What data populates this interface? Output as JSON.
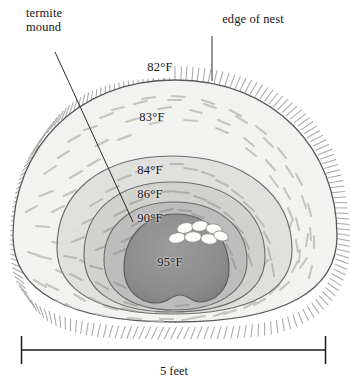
{
  "figure": {
    "callouts": [
      {
        "id": "termite-mound",
        "text": "termite\nmound"
      },
      {
        "id": "edge-of-nest",
        "text": "edge of nest"
      }
    ],
    "temperature_zones": [
      {
        "id": "zone-82",
        "label": "82°F",
        "x": 160,
        "y": 67,
        "fill": "#f2f2f0"
      },
      {
        "id": "zone-83",
        "label": "83°F",
        "x": 152,
        "y": 117,
        "fill": "#ebebe9"
      },
      {
        "id": "zone-84",
        "label": "84°F",
        "x": 150,
        "y": 170,
        "fill": "#dcdcda"
      },
      {
        "id": "zone-86",
        "label": "86°F",
        "x": 150,
        "y": 194,
        "fill": "#cecece"
      },
      {
        "id": "zone-90",
        "label": "90°F",
        "x": 150,
        "y": 218,
        "fill": "#bdbdbd"
      },
      {
        "id": "zone-95",
        "label": "95°F",
        "x": 170,
        "y": 262,
        "fill": "#8f8f8f"
      }
    ],
    "egg_cluster": {
      "id": "egg-cluster",
      "count": 7,
      "fill": "#fdfdfb"
    },
    "scale_bar": {
      "id": "scale-bar",
      "caption": "5 feet",
      "x_start": 21,
      "x_end": 326,
      "y": 350
    },
    "colors": {
      "outline": "#4a4a4a",
      "fuzz": "#9a9a96",
      "text": "#161616",
      "background": "#ffffff",
      "debris": "#b9b9b4"
    }
  }
}
